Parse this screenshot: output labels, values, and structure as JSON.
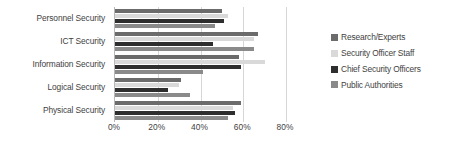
{
  "chart_data": {
    "type": "bar",
    "orientation": "horizontal",
    "title": "",
    "xlabel": "",
    "ylabel": "",
    "xlim": [
      0,
      80
    ],
    "grid": true,
    "legend_position": "right",
    "categories": [
      "Personnel Security",
      "ICT Security",
      "Information Security",
      "Logical Security",
      "Physical Security"
    ],
    "tick_labels": [
      "0%",
      "20%",
      "40%",
      "60%",
      "80%"
    ],
    "tick_values": [
      0,
      20,
      40,
      60,
      80
    ],
    "series": [
      {
        "name": "Research/Experts",
        "color": "#6b6b6b",
        "values": [
          50,
          67,
          58,
          31,
          59
        ]
      },
      {
        "name": "Security Officer Staff",
        "color": "#d9d9d9",
        "values": [
          53,
          65,
          70,
          30,
          55
        ]
      },
      {
        "name": "Chief Security Officers",
        "color": "#2e2e2e",
        "values": [
          51,
          46,
          59,
          25,
          56
        ]
      },
      {
        "name": "Public Authorities",
        "color": "#8a8a8a",
        "values": [
          47,
          65,
          41,
          35,
          53
        ]
      }
    ]
  }
}
